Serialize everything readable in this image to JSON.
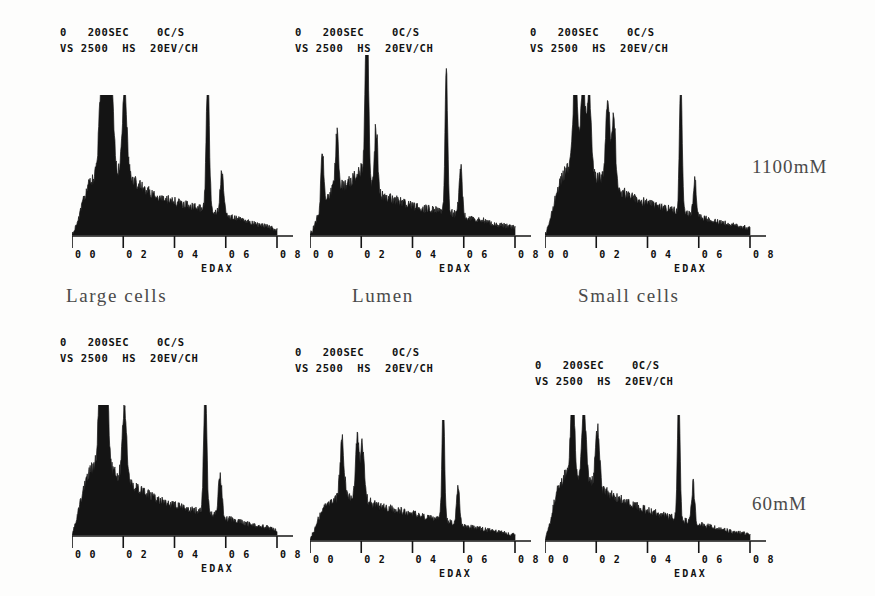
{
  "figure": {
    "caption_labels": {
      "columns": [
        "Large cells",
        "Lumen",
        "Small cells"
      ],
      "rows": [
        "1100mM",
        "60mM"
      ]
    },
    "instrument_header": {
      "line1_start": "0",
      "line1_time": "200SEC",
      "line1_rate": "0C/S",
      "line2_vs": "VS",
      "line2_vs_value": "2500",
      "line2_hs": "HS",
      "line2_energy": "20EV/CH"
    },
    "axis": {
      "tick_labels": [
        "0 0",
        "0 2",
        "0 4",
        "0 6",
        "0 8"
      ],
      "detector_label": "EDAX"
    }
  },
  "chart_data": [
    {
      "type": "area",
      "title": "Large cells - 1100mM",
      "panel_id": "large-cells-1100mm",
      "xlabel": "EDAX",
      "ylabel": "",
      "xlim": [
        0.0,
        0.8
      ],
      "ylim": [
        0,
        100
      ],
      "xticks": [
        0.0,
        0.2,
        0.4,
        0.6,
        0.8
      ],
      "xticklabels": [
        "0 0",
        "0 2",
        "0 4",
        "0 6",
        "0 8"
      ],
      "grid": false,
      "legend": "none",
      "header": "0  200SEC   0C/S / VS 2500  HS  20EV/CH",
      "baseline_profile": [
        [
          0.0,
          0
        ],
        [
          0.02,
          8
        ],
        [
          0.04,
          22
        ],
        [
          0.06,
          34
        ],
        [
          0.08,
          40
        ],
        [
          0.1,
          44
        ],
        [
          0.12,
          47
        ],
        [
          0.14,
          49
        ],
        [
          0.16,
          46
        ],
        [
          0.18,
          44
        ],
        [
          0.2,
          45
        ],
        [
          0.22,
          43
        ],
        [
          0.24,
          40
        ],
        [
          0.26,
          36
        ],
        [
          0.28,
          33
        ],
        [
          0.3,
          31
        ],
        [
          0.32,
          29
        ],
        [
          0.34,
          27
        ],
        [
          0.36,
          26
        ],
        [
          0.38,
          25
        ],
        [
          0.4,
          24
        ],
        [
          0.44,
          22
        ],
        [
          0.48,
          20
        ],
        [
          0.52,
          18
        ],
        [
          0.56,
          16
        ],
        [
          0.6,
          14
        ],
        [
          0.64,
          12
        ],
        [
          0.68,
          10
        ],
        [
          0.72,
          8
        ],
        [
          0.76,
          6
        ],
        [
          0.8,
          4
        ]
      ],
      "peaks": [
        {
          "x": 0.115,
          "height": 62,
          "width": 0.009,
          "element": "P"
        },
        {
          "x": 0.135,
          "height": 57,
          "width": 0.008,
          "element": "S"
        },
        {
          "x": 0.155,
          "height": 60,
          "width": 0.008,
          "element": "Cl"
        },
        {
          "x": 0.205,
          "height": 58,
          "width": 0.009,
          "element": "K"
        },
        {
          "x": 0.53,
          "height": 100,
          "width": 0.006,
          "element": "Ca"
        },
        {
          "x": 0.585,
          "height": 30,
          "width": 0.007,
          "element": "Ca-b"
        }
      ]
    },
    {
      "type": "area",
      "title": "Lumen - 1100mM",
      "panel_id": "lumen-1100mm",
      "xlabel": "EDAX",
      "ylabel": "",
      "xlim": [
        0.0,
        0.8
      ],
      "ylim": [
        0,
        100
      ],
      "xticks": [
        0.0,
        0.2,
        0.4,
        0.6,
        0.8
      ],
      "xticklabels": [
        "0 0",
        "0 2",
        "0 4",
        "0 6",
        "0 8"
      ],
      "grid": false,
      "legend": "none",
      "header": "0  200SEC   0C/S / VS 2500  HS  20EV/CH",
      "baseline_profile": [
        [
          0.0,
          0
        ],
        [
          0.02,
          6
        ],
        [
          0.04,
          14
        ],
        [
          0.06,
          20
        ],
        [
          0.08,
          24
        ],
        [
          0.1,
          26
        ],
        [
          0.12,
          27
        ],
        [
          0.14,
          28
        ],
        [
          0.16,
          30
        ],
        [
          0.18,
          33
        ],
        [
          0.2,
          36
        ],
        [
          0.22,
          34
        ],
        [
          0.24,
          28
        ],
        [
          0.26,
          24
        ],
        [
          0.28,
          22
        ],
        [
          0.3,
          21
        ],
        [
          0.32,
          20
        ],
        [
          0.34,
          19
        ],
        [
          0.36,
          18
        ],
        [
          0.38,
          17
        ],
        [
          0.4,
          16
        ],
        [
          0.44,
          15
        ],
        [
          0.48,
          14
        ],
        [
          0.52,
          13
        ],
        [
          0.56,
          12
        ],
        [
          0.6,
          10
        ],
        [
          0.64,
          9
        ],
        [
          0.68,
          8
        ],
        [
          0.72,
          6
        ],
        [
          0.76,
          5
        ],
        [
          0.8,
          4
        ]
      ],
      "peaks": [
        {
          "x": 0.048,
          "height": 32,
          "width": 0.005,
          "element": "Na"
        },
        {
          "x": 0.105,
          "height": 30,
          "width": 0.006,
          "element": "P"
        },
        {
          "x": 0.222,
          "height": 100,
          "width": 0.006,
          "element": "K"
        },
        {
          "x": 0.258,
          "height": 36,
          "width": 0.006,
          "element": "K-b"
        },
        {
          "x": 0.532,
          "height": 82,
          "width": 0.005,
          "element": "Ca"
        },
        {
          "x": 0.588,
          "height": 28,
          "width": 0.006,
          "element": "Ca-b"
        }
      ]
    },
    {
      "type": "area",
      "title": "Small cells - 1100mM",
      "panel_id": "small-cells-1100mm",
      "xlabel": "EDAX",
      "ylabel": "",
      "xlim": [
        0.0,
        0.8
      ],
      "ylim": [
        0,
        100
      ],
      "xticks": [
        0.0,
        0.2,
        0.4,
        0.6,
        0.8
      ],
      "xticklabels": [
        "0 0",
        "0 2",
        "0 4",
        "0 6",
        "0 8"
      ],
      "grid": false,
      "legend": "none",
      "header": "0  200SEC   0C/S / VS 2500  HS  20EV/CH",
      "baseline_profile": [
        [
          0.0,
          0
        ],
        [
          0.02,
          10
        ],
        [
          0.04,
          26
        ],
        [
          0.06,
          38
        ],
        [
          0.08,
          46
        ],
        [
          0.1,
          50
        ],
        [
          0.12,
          52
        ],
        [
          0.14,
          50
        ],
        [
          0.16,
          47
        ],
        [
          0.18,
          44
        ],
        [
          0.2,
          42
        ],
        [
          0.22,
          40
        ],
        [
          0.24,
          39
        ],
        [
          0.26,
          37
        ],
        [
          0.28,
          34
        ],
        [
          0.3,
          31
        ],
        [
          0.32,
          29
        ],
        [
          0.34,
          27
        ],
        [
          0.36,
          25
        ],
        [
          0.38,
          24
        ],
        [
          0.4,
          23
        ],
        [
          0.44,
          21
        ],
        [
          0.48,
          19
        ],
        [
          0.52,
          17
        ],
        [
          0.56,
          15
        ],
        [
          0.6,
          13
        ],
        [
          0.64,
          11
        ],
        [
          0.68,
          9
        ],
        [
          0.72,
          8
        ],
        [
          0.76,
          6
        ],
        [
          0.8,
          5
        ]
      ],
      "peaks": [
        {
          "x": 0.118,
          "height": 68,
          "width": 0.008,
          "element": "P"
        },
        {
          "x": 0.148,
          "height": 62,
          "width": 0.008,
          "element": "S"
        },
        {
          "x": 0.172,
          "height": 58,
          "width": 0.008,
          "element": "Cl"
        },
        {
          "x": 0.245,
          "height": 58,
          "width": 0.008,
          "element": "K"
        },
        {
          "x": 0.268,
          "height": 50,
          "width": 0.007,
          "element": "K-b"
        },
        {
          "x": 0.53,
          "height": 100,
          "width": 0.005,
          "element": "Ca"
        },
        {
          "x": 0.585,
          "height": 26,
          "width": 0.006,
          "element": "Ca-b"
        }
      ]
    },
    {
      "type": "area",
      "title": "Large cells - 60mM",
      "panel_id": "large-cells-60mm",
      "xlabel": "EDAX",
      "ylabel": "",
      "xlim": [
        0.0,
        0.8
      ],
      "ylim": [
        0,
        100
      ],
      "xticks": [
        0.0,
        0.2,
        0.4,
        0.6,
        0.8
      ],
      "xticklabels": [
        "0 0",
        "0 2",
        "0 4",
        "0 6",
        "0 8"
      ],
      "grid": false,
      "legend": "none",
      "header": "0  200SEC   0C/S / VS 2500  HS  20EV/CH",
      "baseline_profile": [
        [
          0.0,
          0
        ],
        [
          0.02,
          14
        ],
        [
          0.04,
          32
        ],
        [
          0.06,
          44
        ],
        [
          0.08,
          52
        ],
        [
          0.1,
          56
        ],
        [
          0.12,
          57
        ],
        [
          0.14,
          52
        ],
        [
          0.16,
          48
        ],
        [
          0.18,
          46
        ],
        [
          0.2,
          44
        ],
        [
          0.22,
          40
        ],
        [
          0.24,
          37
        ],
        [
          0.26,
          35
        ],
        [
          0.28,
          33
        ],
        [
          0.3,
          31
        ],
        [
          0.32,
          29
        ],
        [
          0.34,
          27
        ],
        [
          0.36,
          26
        ],
        [
          0.38,
          24
        ],
        [
          0.4,
          23
        ],
        [
          0.44,
          21
        ],
        [
          0.48,
          19
        ],
        [
          0.52,
          17
        ],
        [
          0.56,
          15
        ],
        [
          0.6,
          13
        ],
        [
          0.64,
          11
        ],
        [
          0.68,
          9
        ],
        [
          0.72,
          7
        ],
        [
          0.76,
          6
        ],
        [
          0.8,
          4
        ]
      ],
      "peaks": [
        {
          "x": 0.112,
          "height": 74,
          "width": 0.008,
          "element": "P"
        },
        {
          "x": 0.135,
          "height": 64,
          "width": 0.008,
          "element": "S"
        },
        {
          "x": 0.205,
          "height": 58,
          "width": 0.008,
          "element": "Cl"
        },
        {
          "x": 0.52,
          "height": 100,
          "width": 0.006,
          "element": "Ca"
        },
        {
          "x": 0.578,
          "height": 32,
          "width": 0.007,
          "element": "Ca-b"
        }
      ]
    },
    {
      "type": "area",
      "title": "Lumen - 60mM",
      "panel_id": "lumen-60mm",
      "xlabel": "EDAX",
      "ylabel": "",
      "xlim": [
        0.0,
        0.8
      ],
      "ylim": [
        0,
        100
      ],
      "xticks": [
        0.0,
        0.2,
        0.4,
        0.6,
        0.8
      ],
      "xticklabels": [
        "0 0",
        "0 2",
        "0 4",
        "0 6",
        "0 8"
      ],
      "grid": false,
      "legend": "none",
      "header": "0  200SEC   0C/S / VS 2500  HS  20EV/CH",
      "baseline_profile": [
        [
          0.0,
          0
        ],
        [
          0.02,
          10
        ],
        [
          0.04,
          22
        ],
        [
          0.06,
          28
        ],
        [
          0.08,
          31
        ],
        [
          0.1,
          33
        ],
        [
          0.12,
          35
        ],
        [
          0.14,
          36
        ],
        [
          0.16,
          37
        ],
        [
          0.18,
          36
        ],
        [
          0.2,
          35
        ],
        [
          0.22,
          33
        ],
        [
          0.24,
          31
        ],
        [
          0.26,
          29
        ],
        [
          0.28,
          28
        ],
        [
          0.3,
          27
        ],
        [
          0.32,
          26
        ],
        [
          0.34,
          25
        ],
        [
          0.36,
          24
        ],
        [
          0.38,
          23
        ],
        [
          0.4,
          22
        ],
        [
          0.44,
          20
        ],
        [
          0.48,
          18
        ],
        [
          0.52,
          16
        ],
        [
          0.56,
          14
        ],
        [
          0.6,
          12
        ],
        [
          0.64,
          10
        ],
        [
          0.68,
          9
        ],
        [
          0.72,
          7
        ],
        [
          0.76,
          6
        ],
        [
          0.8,
          4
        ]
      ],
      "peaks": [
        {
          "x": 0.125,
          "height": 48,
          "width": 0.008,
          "element": "P"
        },
        {
          "x": 0.185,
          "height": 50,
          "width": 0.007,
          "element": "Cl"
        },
        {
          "x": 0.205,
          "height": 44,
          "width": 0.007,
          "element": "K"
        },
        {
          "x": 0.52,
          "height": 100,
          "width": 0.005,
          "element": "Ca"
        },
        {
          "x": 0.578,
          "height": 30,
          "width": 0.006,
          "element": "Ca-b"
        }
      ]
    },
    {
      "type": "area",
      "title": "Small cells - 60mM",
      "panel_id": "small-cells-60mm",
      "xlabel": "EDAX",
      "ylabel": "",
      "xlim": [
        0.0,
        0.8
      ],
      "ylim": [
        0,
        100
      ],
      "xticks": [
        0.0,
        0.2,
        0.4,
        0.6,
        0.8
      ],
      "xticklabels": [
        "0 0",
        "0 2",
        "0 4",
        "0 6",
        "0 8"
      ],
      "grid": false,
      "legend": "none",
      "header": "0  200SEC   0C/S / VS 2500  HS  20EV/CH",
      "baseline_profile": [
        [
          0.0,
          0
        ],
        [
          0.02,
          14
        ],
        [
          0.04,
          34
        ],
        [
          0.06,
          46
        ],
        [
          0.08,
          52
        ],
        [
          0.1,
          54
        ],
        [
          0.12,
          52
        ],
        [
          0.14,
          49
        ],
        [
          0.16,
          47
        ],
        [
          0.18,
          45
        ],
        [
          0.2,
          43
        ],
        [
          0.22,
          40
        ],
        [
          0.24,
          38
        ],
        [
          0.26,
          36
        ],
        [
          0.28,
          34
        ],
        [
          0.3,
          32
        ],
        [
          0.32,
          30
        ],
        [
          0.34,
          28
        ],
        [
          0.36,
          27
        ],
        [
          0.38,
          25
        ],
        [
          0.4,
          24
        ],
        [
          0.44,
          21
        ],
        [
          0.48,
          19
        ],
        [
          0.52,
          17
        ],
        [
          0.56,
          15
        ],
        [
          0.6,
          13
        ],
        [
          0.64,
          11
        ],
        [
          0.68,
          9
        ],
        [
          0.72,
          7
        ],
        [
          0.76,
          6
        ],
        [
          0.8,
          4
        ]
      ],
      "peaks": [
        {
          "x": 0.108,
          "height": 78,
          "width": 0.007,
          "element": "P"
        },
        {
          "x": 0.152,
          "height": 62,
          "width": 0.008,
          "element": "S"
        },
        {
          "x": 0.205,
          "height": 46,
          "width": 0.008,
          "element": "Cl"
        },
        {
          "x": 0.522,
          "height": 100,
          "width": 0.005,
          "element": "Ca"
        },
        {
          "x": 0.578,
          "height": 30,
          "width": 0.006,
          "element": "Ca-b"
        }
      ]
    }
  ],
  "layout": {
    "panels": [
      {
        "id": "large-cells-1100mm",
        "plot_x": 72,
        "plot_y": 95,
        "plot_w": 205,
        "plot_h": 140,
        "hdr_x": 60,
        "hdr_y": 24
      },
      {
        "id": "lumen-1100mm",
        "plot_x": 310,
        "plot_y": 55,
        "plot_w": 205,
        "plot_h": 180,
        "hdr_x": 295,
        "hdr_y": 24
      },
      {
        "id": "small-cells-1100mm",
        "plot_x": 545,
        "plot_y": 95,
        "plot_w": 205,
        "plot_h": 140,
        "hdr_x": 530,
        "hdr_y": 24
      },
      {
        "id": "large-cells-60mm",
        "plot_x": 72,
        "plot_y": 405,
        "plot_w": 205,
        "plot_h": 130,
        "hdr_x": 60,
        "hdr_y": 334
      },
      {
        "id": "lumen-60mm",
        "plot_x": 310,
        "plot_y": 420,
        "plot_w": 205,
        "plot_h": 120,
        "hdr_x": 295,
        "hdr_y": 344
      },
      {
        "id": "small-cells-60mm",
        "plot_x": 545,
        "plot_y": 415,
        "plot_w": 205,
        "plot_h": 125,
        "hdr_x": 535,
        "hdr_y": 357
      }
    ],
    "column_labels": [
      {
        "text_index": 0,
        "x": 66,
        "y": 285
      },
      {
        "text_index": 1,
        "x": 352,
        "y": 285
      },
      {
        "text_index": 2,
        "x": 578,
        "y": 285
      }
    ],
    "row_labels": [
      {
        "text_index": 0,
        "x": 752,
        "y": 156
      },
      {
        "text_index": 1,
        "x": 752,
        "y": 493
      }
    ]
  }
}
